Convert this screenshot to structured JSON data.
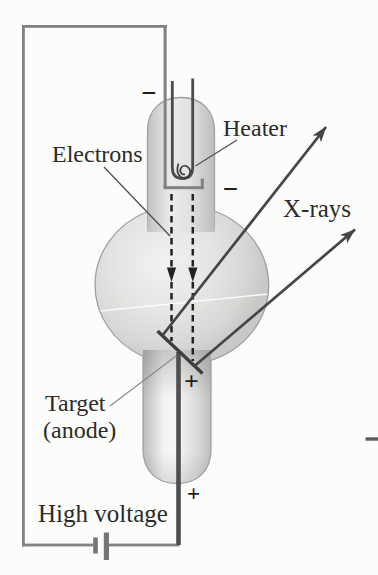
{
  "figure": {
    "labels": {
      "heater": "Heater",
      "electrons": "Electrons",
      "xrays": "X-rays",
      "target_line1": "Target",
      "target_line2": "(anode)",
      "high_voltage": "High voltage"
    },
    "symbols": {
      "cathode_minus_top": "−",
      "cathode_minus_side": "−",
      "target_plus": "+",
      "anode_plus_bottom": "+"
    },
    "colors": {
      "background": "#fcfcfa",
      "circuit_wire": "#828282",
      "glass_fill": "#d6d6d4",
      "glass_outline": "#a0a0a0",
      "dark_line": "#3e3e3e",
      "text": "#2b2b2b"
    }
  }
}
